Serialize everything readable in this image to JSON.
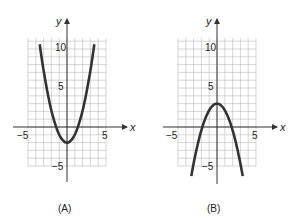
{
  "chart_data": [
    {
      "type": "line",
      "panel_label": "(A)",
      "xlabel": "x",
      "ylabel": "y",
      "xlim": [
        -5,
        5
      ],
      "ylim": [
        -5,
        11
      ],
      "grid": true,
      "x_tick_labels": [
        "-5",
        "5"
      ],
      "y_tick_labels": [
        "10",
        "5",
        "-5"
      ],
      "series": [
        {
          "name": "parabola",
          "equation": "y = 1.2x^2 - 2",
          "vertex": [
            0,
            -2
          ],
          "x": [
            -3.5,
            -3,
            -2,
            -1,
            0,
            1,
            2,
            3,
            3.5
          ],
          "y": [
            12.7,
            8.8,
            2.8,
            -0.8,
            -2,
            -0.8,
            2.8,
            8.8,
            12.7
          ]
        }
      ]
    },
    {
      "type": "line",
      "panel_label": "(B)",
      "xlabel": "x",
      "ylabel": "y",
      "xlim": [
        -5,
        5
      ],
      "ylim": [
        -5,
        11
      ],
      "grid": true,
      "x_tick_labels": [
        "-5",
        "5"
      ],
      "y_tick_labels": [
        "10",
        "5",
        "-5"
      ],
      "series": [
        {
          "name": "parabola",
          "equation": "y = 3 - 0.85x^2",
          "vertex": [
            0,
            3
          ],
          "x": [
            -3.3,
            -3,
            -2,
            -1,
            0,
            1,
            2,
            3,
            3.3
          ],
          "y": [
            -6.3,
            -4.65,
            -0.4,
            2.15,
            3,
            2.15,
            -0.4,
            -4.65,
            -6.3
          ]
        }
      ]
    }
  ],
  "panels": [
    {
      "caption": "(A)",
      "x_axis_label": "x",
      "y_axis_label": "y",
      "tick_neg5_x": "−5",
      "tick_5_x": "5",
      "tick_10_y": "10",
      "tick_5_y": "5",
      "tick_neg5_y": "−5"
    },
    {
      "caption": "(B)",
      "x_axis_label": "x",
      "y_axis_label": "y",
      "tick_neg5_x": "−5",
      "tick_5_x": "5",
      "tick_10_y": "10",
      "tick_5_y": "5",
      "tick_neg5_y": "−5"
    }
  ]
}
